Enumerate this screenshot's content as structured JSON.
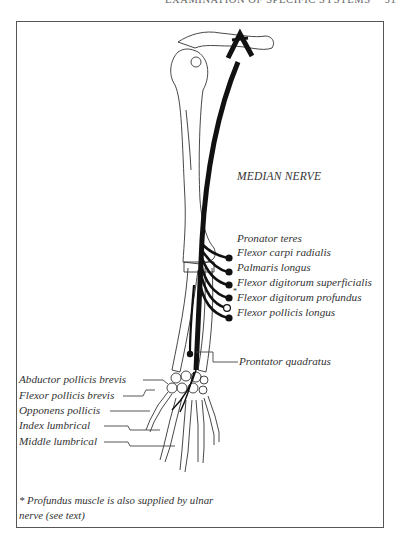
{
  "header": {
    "running_title": "EXAMINATION OF SPECIFIC SYSTEMS",
    "page_number": "51"
  },
  "figure": {
    "title": "MEDIAN NERVE",
    "forearm_muscles": [
      {
        "label": "Pronator teres",
        "marker": "filled"
      },
      {
        "label": "Flexor carpi radialis",
        "marker": "filled"
      },
      {
        "label": "Palmaris longus",
        "marker": "filled"
      },
      {
        "label": "Flexor digitorum superficialis",
        "marker": "filled"
      },
      {
        "label": "Flexor digitorum profundus",
        "marker": "open",
        "asterisk": "*"
      },
      {
        "label": "Flexor pollicis longus",
        "marker": "filled"
      }
    ],
    "wrist_muscle": {
      "label": "Prontator quadratus"
    },
    "hand_muscles": [
      {
        "label": "Abductor pollicis brevis"
      },
      {
        "label": "Flexor pollicis brevis"
      },
      {
        "label": "Opponens pollicis"
      },
      {
        "label": "Index lumbrical"
      },
      {
        "label": "Middle lumbrical"
      }
    ],
    "footnote_line1": "* Profundus muscle is also supplied by ulnar",
    "footnote_line2": "nerve (see text)",
    "colors": {
      "ink": "#1a1a1a",
      "frame": "#555555",
      "text": "#333333"
    }
  }
}
